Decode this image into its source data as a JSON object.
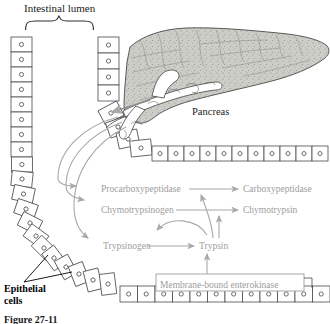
{
  "figure": {
    "title_label": "Intestinal lumen",
    "pancreas_label": "Pancreas",
    "epithelial_label": "Epithelial cells",
    "caption": "Figure 27-11",
    "enterokinase_label": "Membrane-bound enterokinase"
  },
  "cascade": {
    "proenzymes": [
      {
        "name": "Procarboxypeptidase"
      },
      {
        "name": "Chymotrypsinogen"
      },
      {
        "name": "Trypsinogen"
      }
    ],
    "active_enzymes": [
      {
        "name": "Carboxypeptidase"
      },
      {
        "name": "Chymotrypsin"
      },
      {
        "name": "Trypsin"
      }
    ],
    "reactions": [
      {
        "substrate": "Procarboxypeptidase",
        "product": "Carboxypeptidase",
        "catalyst": "Trypsin"
      },
      {
        "substrate": "Chymotrypsinogen",
        "product": "Chymotrypsin",
        "catalyst": "Trypsin"
      },
      {
        "substrate": "Trypsinogen",
        "product": "Trypsin",
        "catalyst": "Membrane-bound enterokinase"
      },
      {
        "substrate": "Trypsinogen",
        "product": "Trypsin",
        "catalyst": "Trypsin"
      }
    ]
  },
  "colors": {
    "enzyme_text": "#9d9d9d",
    "arrow_gray": "#a8a8a8",
    "outline": "#3a3a3a",
    "label_text": "#1a1a1a",
    "pancreas_fill": "#c9c9c4",
    "cell_fill": "#ffffff"
  },
  "structures": {
    "epithelium_left_cells": 9,
    "epithelium_right_cells": 4,
    "epithelium_arc_cells": 11,
    "epithelium_bottom_cells": 12,
    "epithelium_top_row_cells": 11,
    "secretion_arrows": 3
  }
}
